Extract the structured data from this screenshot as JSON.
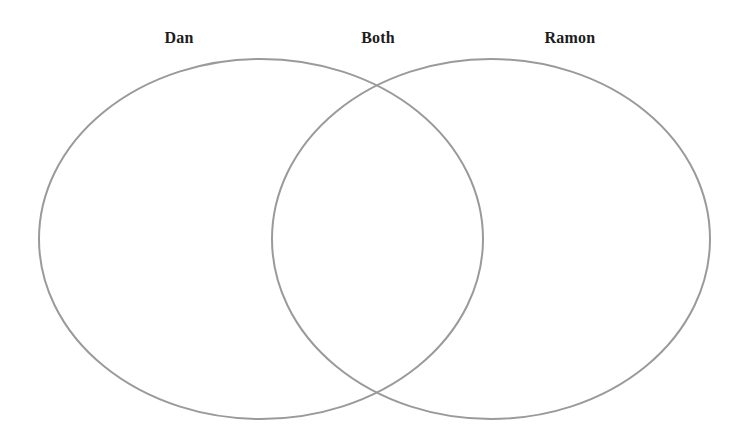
{
  "page": {
    "background_color": "#ffffff"
  },
  "diagram": {
    "type": "venn-2-set",
    "stroke_color": "#9a9a9a",
    "stroke_width": 2,
    "fill": "none",
    "left_circle": {
      "label": "Dan",
      "center_x": 261,
      "center_y": 239,
      "radius_x": 222,
      "radius_y": 180
    },
    "right_circle": {
      "label": "Ramon",
      "center_x": 491,
      "center_y": 239,
      "radius_x": 219,
      "radius_y": 180
    },
    "intersection": {
      "label": "Both",
      "top_crossing_x": 378,
      "top_crossing_y": 92,
      "bottom_crossing_x": 375,
      "bottom_crossing_y": 388
    }
  },
  "labels": {
    "left": "Dan",
    "both": "Both",
    "right": "Ramon"
  }
}
